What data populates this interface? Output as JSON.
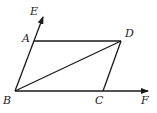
{
  "diagram": {
    "type": "geometry",
    "points": {
      "A": {
        "label": "A",
        "x": 34,
        "y": 41
      },
      "B": {
        "label": "B",
        "x": 15,
        "y": 91
      },
      "C": {
        "label": "C",
        "x": 103,
        "y": 91
      },
      "D": {
        "label": "D",
        "x": 121,
        "y": 41
      },
      "E": {
        "label": "E",
        "x": 43,
        "y": 17
      },
      "F": {
        "label": "F",
        "x": 148,
        "y": 91
      }
    },
    "segments": [
      [
        "A",
        "D"
      ],
      [
        "D",
        "C"
      ],
      [
        "B",
        "D"
      ],
      [
        "B",
        "A"
      ],
      [
        "B",
        "C"
      ]
    ],
    "rays": [
      [
        "B",
        "E"
      ],
      [
        "B",
        "F"
      ]
    ],
    "colors": {
      "stroke": "#1a1a1a",
      "label": "#222222",
      "background": "#ffffff"
    }
  }
}
